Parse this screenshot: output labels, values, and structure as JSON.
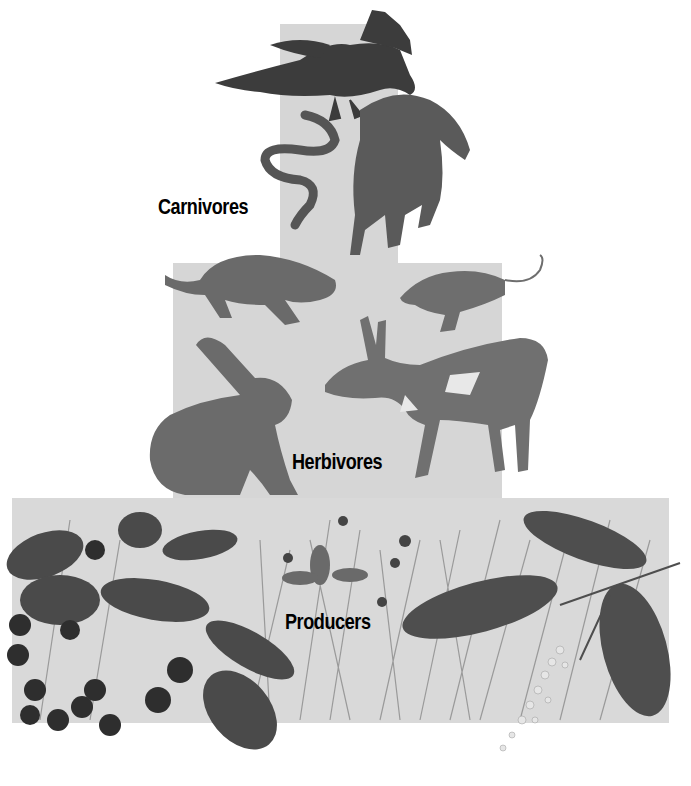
{
  "diagram": {
    "type": "ecological pyramid",
    "tiers": [
      {
        "label": "Carnivores",
        "organisms": [
          "eagle",
          "snake",
          "coyote"
        ]
      },
      {
        "label": "Herbivores",
        "organisms": [
          "ground squirrel",
          "mouse",
          "jackrabbit",
          "pronghorn"
        ]
      },
      {
        "label": "Producers",
        "organisms": [
          "berry shrub",
          "wild strawberry",
          "grasses",
          "flowering tree branch"
        ]
      }
    ],
    "colors": {
      "tier_fill": "#d6d6d6",
      "ink": "#3a3a3a",
      "text": "#000000",
      "background": "#ffffff"
    }
  }
}
